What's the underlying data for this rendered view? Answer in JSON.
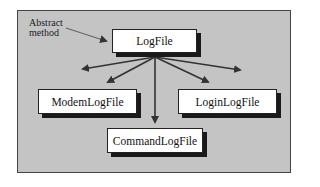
{
  "diagram": {
    "annotation": {
      "line1": "Abstract",
      "line2": "method"
    },
    "root": {
      "label": "LogFile"
    },
    "children": [
      {
        "label": "ModemLogFile"
      },
      {
        "label": "LoginLogFile"
      },
      {
        "label": "CommandLogFile"
      }
    ],
    "colors": {
      "background": "#c4c4c4",
      "box": "#ffffff",
      "shadow": "#1a1a1a",
      "arrow": "#333333"
    }
  }
}
